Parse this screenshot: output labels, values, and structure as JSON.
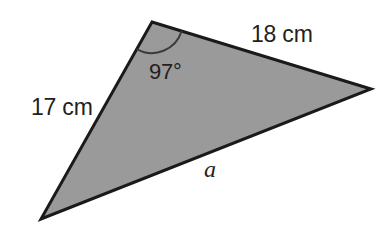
{
  "figure": {
    "background_color": "#ffffff",
    "shape": {
      "name": "triangle",
      "fill_color": "#9a9a9a",
      "stroke_color": "#1a1a1a",
      "stroke_width": 3,
      "vertices": [
        {
          "name": "apex",
          "x": 152,
          "y": 22
        },
        {
          "name": "right",
          "x": 371,
          "y": 89
        },
        {
          "name": "bottom-left",
          "x": 41,
          "y": 219
        }
      ]
    },
    "angle_arc": {
      "at_vertex": "apex",
      "radius": 31,
      "stroke_color": "#3a3a3a",
      "stroke_width": 2
    },
    "labels": {
      "side_top_right": "18 cm",
      "side_left": "17 cm",
      "angle": "97°",
      "unknown_side": "a"
    }
  },
  "chart_data": {
    "type": "diagram",
    "annotations": [
      {
        "text": "18 cm",
        "role": "side-length",
        "side": "apex-to-right"
      },
      {
        "text": "17 cm",
        "role": "side-length",
        "side": "apex-to-bottom-left"
      },
      {
        "text": "97°",
        "role": "angle-measure",
        "vertex": "apex"
      },
      {
        "text": "a",
        "role": "unknown-side-label",
        "side": "bottom-left-to-right"
      }
    ]
  }
}
